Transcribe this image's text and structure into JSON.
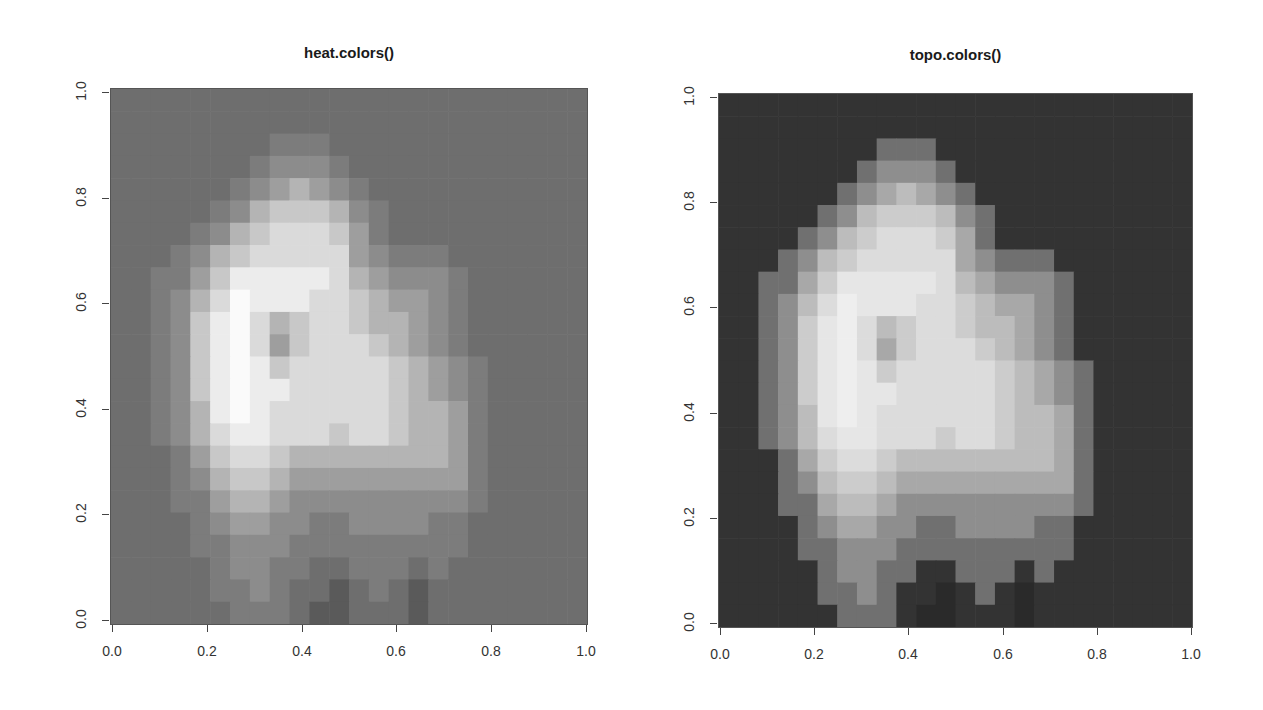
{
  "chart_data": [
    {
      "type": "heatmap",
      "title": "heat.colors()",
      "xlabel": "",
      "ylabel": "",
      "xlim": [
        0,
        1
      ],
      "ylim": [
        0,
        1
      ],
      "x_ticks": [
        "0.0",
        "0.2",
        "0.4",
        "0.6",
        "0.8",
        "1.0"
      ],
      "y_ticks": [
        "0.0",
        "0.2",
        "0.4",
        "0.6",
        "0.8",
        "1.0"
      ],
      "palette_name": "heat.colors",
      "palette": [
        "#5a5a5a",
        "#6e6e6e",
        "#7c7c7c",
        "#8c8c8c",
        "#9e9e9e",
        "#b4b4b4",
        "#c8c8c8",
        "#dadada",
        "#ececec",
        "#fafafa"
      ],
      "grid_ref": "shared_grid"
    },
    {
      "type": "heatmap",
      "title": "topo.colors()",
      "xlabel": "",
      "ylabel": "",
      "xlim": [
        0,
        1
      ],
      "ylim": [
        0,
        1
      ],
      "x_ticks": [
        "0.0",
        "0.2",
        "0.4",
        "0.6",
        "0.8",
        "1.0"
      ],
      "y_ticks": [
        "0.0",
        "0.2",
        "0.4",
        "0.6",
        "0.8",
        "1.0"
      ],
      "palette_name": "topo.colors",
      "palette": [
        "#2a2a2a",
        "#333333",
        "#707070",
        "#8e8e8e",
        "#a8a8a8",
        "#bcbcbc",
        "#cccccc",
        "#dcdcdc",
        "#e6e6e6",
        "#eeeeee"
      ],
      "grid_ref": "shared_grid"
    }
  ],
  "shared_grid": {
    "description": "Approximate elevation levels (0=low, 9=high), rows from y=1 (top) to y=0 (bottom), columns from x=0 to x=1",
    "rows": [
      [
        1,
        1,
        1,
        1,
        1,
        1,
        1,
        1,
        1,
        1,
        1,
        1,
        1,
        1,
        1,
        1,
        1,
        1,
        1,
        1,
        1,
        1,
        1,
        1
      ],
      [
        1,
        1,
        1,
        1,
        1,
        1,
        1,
        1,
        1,
        1,
        1,
        1,
        1,
        1,
        1,
        1,
        1,
        1,
        1,
        1,
        1,
        1,
        1,
        1
      ],
      [
        1,
        1,
        1,
        1,
        1,
        1,
        1,
        1,
        2,
        2,
        2,
        1,
        1,
        1,
        1,
        1,
        1,
        1,
        1,
        1,
        1,
        1,
        1,
        1
      ],
      [
        1,
        1,
        1,
        1,
        1,
        1,
        1,
        2,
        3,
        3,
        3,
        2,
        1,
        1,
        1,
        1,
        1,
        1,
        1,
        1,
        1,
        1,
        1,
        1
      ],
      [
        1,
        1,
        1,
        1,
        1,
        1,
        2,
        3,
        4,
        5,
        4,
        3,
        2,
        1,
        1,
        1,
        1,
        1,
        1,
        1,
        1,
        1,
        1,
        1
      ],
      [
        1,
        1,
        1,
        1,
        1,
        2,
        3,
        5,
        6,
        6,
        6,
        5,
        3,
        2,
        1,
        1,
        1,
        1,
        1,
        1,
        1,
        1,
        1,
        1
      ],
      [
        1,
        1,
        1,
        1,
        2,
        3,
        5,
        6,
        7,
        7,
        7,
        6,
        4,
        2,
        1,
        1,
        1,
        1,
        1,
        1,
        1,
        1,
        1,
        1
      ],
      [
        1,
        1,
        1,
        2,
        3,
        5,
        6,
        7,
        7,
        7,
        7,
        7,
        4,
        3,
        2,
        2,
        2,
        1,
        1,
        1,
        1,
        1,
        1,
        1
      ],
      [
        1,
        1,
        2,
        2,
        4,
        6,
        8,
        8,
        8,
        8,
        8,
        7,
        5,
        4,
        3,
        3,
        3,
        2,
        1,
        1,
        1,
        1,
        1,
        1
      ],
      [
        1,
        1,
        2,
        3,
        5,
        7,
        9,
        8,
        8,
        8,
        7,
        7,
        6,
        5,
        4,
        4,
        3,
        2,
        1,
        1,
        1,
        1,
        1,
        1
      ],
      [
        1,
        1,
        2,
        3,
        6,
        8,
        9,
        7,
        5,
        6,
        7,
        7,
        6,
        5,
        5,
        4,
        3,
        2,
        1,
        1,
        1,
        1,
        1,
        1
      ],
      [
        1,
        1,
        2,
        3,
        6,
        8,
        9,
        7,
        4,
        6,
        7,
        7,
        7,
        6,
        5,
        4,
        3,
        2,
        1,
        1,
        1,
        1,
        1,
        1
      ],
      [
        1,
        1,
        2,
        3,
        6,
        8,
        9,
        8,
        6,
        7,
        7,
        7,
        7,
        7,
        6,
        5,
        4,
        3,
        2,
        1,
        1,
        1,
        1,
        1
      ],
      [
        1,
        1,
        2,
        3,
        6,
        8,
        9,
        8,
        8,
        7,
        7,
        7,
        7,
        7,
        6,
        5,
        4,
        3,
        2,
        1,
        1,
        1,
        1,
        1
      ],
      [
        1,
        1,
        2,
        3,
        5,
        8,
        9,
        8,
        7,
        7,
        7,
        7,
        7,
        7,
        6,
        5,
        5,
        4,
        2,
        1,
        1,
        1,
        1,
        1
      ],
      [
        1,
        1,
        2,
        3,
        5,
        7,
        8,
        8,
        7,
        7,
        7,
        6,
        7,
        7,
        6,
        5,
        5,
        4,
        2,
        1,
        1,
        1,
        1,
        1
      ],
      [
        1,
        1,
        1,
        2,
        4,
        6,
        7,
        7,
        6,
        5,
        5,
        5,
        5,
        5,
        5,
        5,
        5,
        4,
        2,
        1,
        1,
        1,
        1,
        1
      ],
      [
        1,
        1,
        1,
        2,
        3,
        5,
        6,
        6,
        5,
        4,
        4,
        4,
        4,
        4,
        4,
        4,
        4,
        4,
        2,
        1,
        1,
        1,
        1,
        1
      ],
      [
        1,
        1,
        1,
        2,
        2,
        4,
        5,
        5,
        4,
        3,
        3,
        3,
        3,
        3,
        3,
        3,
        3,
        3,
        2,
        1,
        1,
        1,
        1,
        1
      ],
      [
        1,
        1,
        1,
        1,
        2,
        3,
        4,
        4,
        3,
        3,
        2,
        2,
        3,
        3,
        3,
        3,
        2,
        2,
        1,
        1,
        1,
        1,
        1,
        1
      ],
      [
        1,
        1,
        1,
        1,
        2,
        2,
        3,
        3,
        3,
        2,
        2,
        2,
        2,
        2,
        2,
        2,
        2,
        2,
        1,
        1,
        1,
        1,
        1,
        1
      ],
      [
        1,
        1,
        1,
        1,
        1,
        2,
        3,
        3,
        2,
        2,
        1,
        1,
        2,
        2,
        2,
        1,
        2,
        1,
        1,
        1,
        1,
        1,
        1,
        1
      ],
      [
        1,
        1,
        1,
        1,
        1,
        2,
        2,
        3,
        2,
        1,
        1,
        0,
        1,
        2,
        1,
        0,
        1,
        1,
        1,
        1,
        1,
        1,
        1,
        1
      ],
      [
        1,
        1,
        1,
        1,
        1,
        1,
        2,
        2,
        2,
        1,
        0,
        0,
        1,
        1,
        1,
        0,
        1,
        1,
        1,
        1,
        1,
        1,
        1,
        1
      ]
    ]
  }
}
